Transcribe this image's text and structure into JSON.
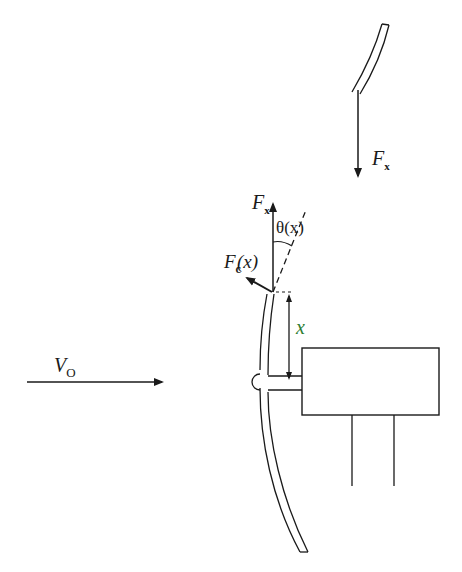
{
  "diagram": {
    "title": "",
    "labels": {
      "fx_top": {
        "main": "F",
        "sub": "x"
      },
      "fx_mid": {
        "main": "F",
        "sub": "x"
      },
      "theta": {
        "text": "θ(x)"
      },
      "fc": {
        "main": "F",
        "sub": "c",
        "arg": "(x)"
      },
      "x_dim": {
        "text": "x"
      },
      "v0": {
        "main": "V",
        "sub": "O"
      }
    },
    "elements": [
      {
        "id": "upper-blade-segment",
        "type": "curved-strip"
      },
      {
        "id": "fx-top-arrow",
        "type": "arrow",
        "direction": "down"
      },
      {
        "id": "fx-mid-arrow",
        "type": "arrow",
        "direction": "up"
      },
      {
        "id": "tangent-line",
        "type": "dashed-line"
      },
      {
        "id": "theta-arc",
        "type": "angle-arc"
      },
      {
        "id": "fc-arrow",
        "type": "arrow",
        "direction": "up-left"
      },
      {
        "id": "x-dimension",
        "type": "double-arrow"
      },
      {
        "id": "blade",
        "type": "curved-strip"
      },
      {
        "id": "hub",
        "type": "semicircle"
      },
      {
        "id": "shaft",
        "type": "rectangle"
      },
      {
        "id": "nacelle",
        "type": "rectangle"
      },
      {
        "id": "tower",
        "type": "two-lines"
      },
      {
        "id": "wind-arrow",
        "type": "arrow",
        "direction": "right"
      }
    ],
    "colors": {
      "ink": "#1a1a1a",
      "background": "#ffffff",
      "accent_x": "#2e7d32"
    }
  }
}
